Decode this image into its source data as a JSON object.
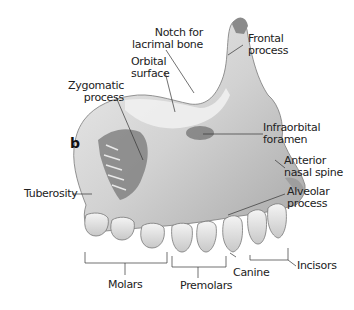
{
  "figure": {
    "panel_letter": "b",
    "labels": {
      "notch_lacrimal": [
        "Notch for",
        "lacrimal bone"
      ],
      "orbital_surface": [
        "Orbital",
        "surface"
      ],
      "zygomatic_process": [
        "Zygomatic",
        "process"
      ],
      "frontal_process": [
        "Frontal",
        "process"
      ],
      "infraorbital_foramen": [
        "Infraorbital",
        "foramen"
      ],
      "anterior_nasal_spine": [
        "Anterior",
        "nasal spine"
      ],
      "alveolar_process": [
        "Alveolar",
        "process"
      ],
      "tuberosity": "Tuberosity",
      "molars": "Molars",
      "premolars": "Premolars",
      "canine": "Canine",
      "incisors": "Incisors"
    },
    "colors": {
      "bone_light": "#e6e6e6",
      "bone_mid": "#bdbdbd",
      "bone_dark": "#6e6e6e",
      "leader_line": "#333333",
      "text": "#222222"
    }
  }
}
